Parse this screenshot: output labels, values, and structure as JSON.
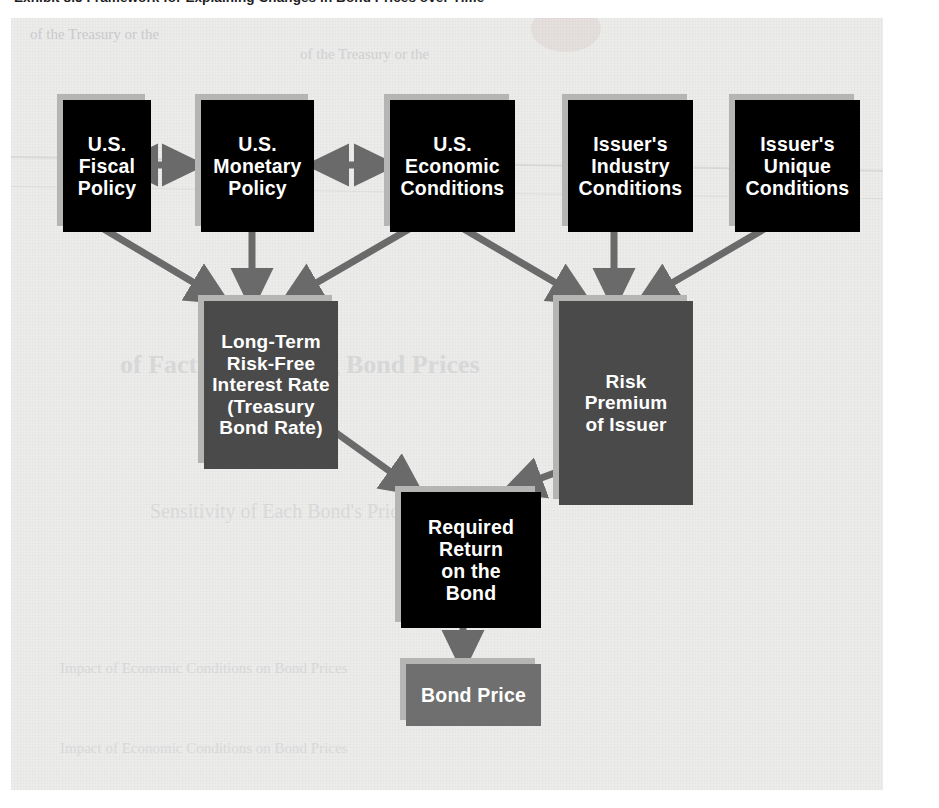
{
  "exhibit": {
    "caption_number": "Exhibit 8.5",
    "caption_text": "Framework for Explaining Changes in Bond Prices over Time",
    "caption_full": "Exhibit 8.5  Framework for Explaining Changes in Bond Prices over Time"
  },
  "colors": {
    "panel_background": "#ececeb",
    "node_black": "#000000",
    "node_dark_gray": "#4a4a4a",
    "node_mid_gray": "#6f6f6f",
    "arrow": "#6a6a6a",
    "shadow": "#b5b5b3",
    "node_text": "#ffffff",
    "caption_text": "#1d1d22"
  },
  "diagram": {
    "type": "flowchart",
    "title": "Framework for Explaining Changes in Bond Prices over Time",
    "nodes": [
      {
        "id": "fiscal",
        "tier": 1,
        "style": "black",
        "lines": [
          "U.S.",
          "Fiscal",
          "Policy"
        ]
      },
      {
        "id": "monetary",
        "tier": 1,
        "style": "black",
        "lines": [
          "U.S.",
          "Monetary",
          "Policy"
        ]
      },
      {
        "id": "economic",
        "tier": 1,
        "style": "black",
        "lines": [
          "U.S.",
          "Economic",
          "Conditions"
        ]
      },
      {
        "id": "industry",
        "tier": 1,
        "style": "black",
        "lines": [
          "Issuer's",
          "Industry",
          "Conditions"
        ]
      },
      {
        "id": "unique",
        "tier": 1,
        "style": "black",
        "lines": [
          "Issuer's",
          "Unique",
          "Conditions"
        ]
      },
      {
        "id": "riskfree",
        "tier": 2,
        "style": "dark",
        "lines": [
          "Long-Term",
          "Risk-Free",
          "Interest Rate",
          "(Treasury",
          "Bond Rate)"
        ]
      },
      {
        "id": "premium",
        "tier": 2,
        "style": "dark",
        "lines": [
          "Risk",
          "Premium",
          "of Issuer"
        ]
      },
      {
        "id": "required",
        "tier": 3,
        "style": "black",
        "lines": [
          "Required",
          "Return",
          "on the",
          "Bond"
        ]
      },
      {
        "id": "bondprice",
        "tier": 4,
        "style": "mid",
        "lines": [
          "Bond Price"
        ]
      }
    ],
    "edges": [
      {
        "from": "fiscal",
        "to": "monetary",
        "kind": "double-headed"
      },
      {
        "from": "monetary",
        "to": "economic",
        "kind": "double-headed"
      },
      {
        "from": "fiscal",
        "to": "riskfree",
        "kind": "arrow"
      },
      {
        "from": "monetary",
        "to": "riskfree",
        "kind": "arrow"
      },
      {
        "from": "economic",
        "to": "riskfree",
        "kind": "arrow"
      },
      {
        "from": "economic",
        "to": "premium",
        "kind": "arrow"
      },
      {
        "from": "industry",
        "to": "premium",
        "kind": "arrow"
      },
      {
        "from": "unique",
        "to": "premium",
        "kind": "arrow"
      },
      {
        "from": "riskfree",
        "to": "required",
        "kind": "arrow"
      },
      {
        "from": "premium",
        "to": "required",
        "kind": "arrow"
      },
      {
        "from": "required",
        "to": "bondprice",
        "kind": "arrow"
      }
    ]
  },
  "background_text": {
    "note": "faint show-through text from the underlying printed page",
    "lines": [
      "Exhibit 8.5 Framework for Explaining Changes in Bond Prices over Time",
      "of the Treasury or the",
      "Impact of Economic Conditions on Bond Prices",
      "Sensitivity of Each Bond's Price",
      "of Factors Affecting Bond Prices"
    ]
  }
}
